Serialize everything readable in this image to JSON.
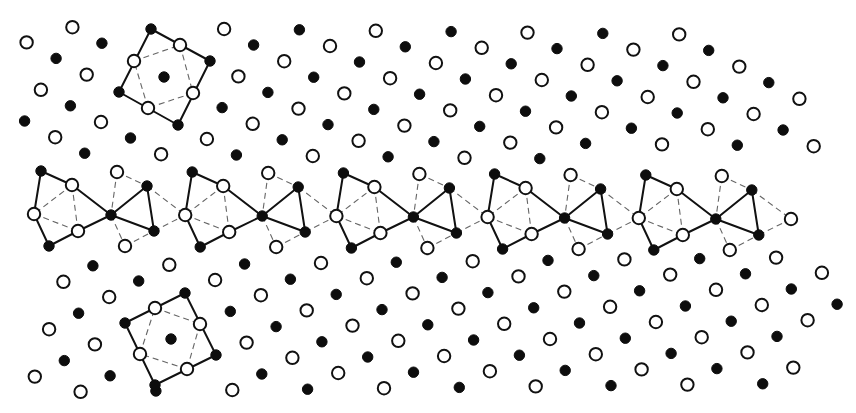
{
  "figure": {
    "width": 856,
    "height": 413,
    "colors": {
      "filled_atom": "#0d0d0d",
      "open_atom_stroke": "#111111",
      "open_atom_fill": "#ffffff",
      "solid_bond": "#111111",
      "dashed_bond": "#666666",
      "background": "#ffffff"
    },
    "atom_radius": {
      "filled": 5.2,
      "open": 6.2
    }
  },
  "lattices": {
    "upper": {
      "open_anchor": [
        330,
        46
      ],
      "a": [
        45.8,
        -15.2
      ],
      "b": [
        14.3,
        47.4
      ],
      "filled_offset": [
        29.5,
        16
      ],
      "y_max": 159
    },
    "lower": {
      "open_anchor": [
        321,
        263
      ],
      "a": [
        45.8,
        15.2
      ],
      "b": [
        -14.3,
        47.4
      ],
      "filled_offset": [
        29.5,
        -16
      ],
      "y_min": 255
    },
    "clip_polygon": [
      [
        15,
        20
      ],
      [
        700,
        20
      ],
      [
        720,
        40
      ],
      [
        808,
        90
      ],
      [
        845,
        200
      ],
      [
        845,
        240
      ],
      [
        840,
        300
      ],
      [
        815,
        370
      ],
      [
        795,
        398
      ],
      [
        20,
        398
      ],
      [
        28,
        350
      ],
      [
        55,
        265
      ],
      [
        20,
        240
      ],
      [
        15,
        160
      ]
    ],
    "exclusions": [
      {
        "center": [
          164,
          77
        ],
        "radius": 52
      },
      {
        "center": [
          171,
          339
        ],
        "radius": 52
      }
    ]
  },
  "square_units": [
    {
      "name": "upper-square-unit",
      "corners_filled": [
        [
          151,
          29
        ],
        [
          210,
          61
        ],
        [
          178,
          125
        ],
        [
          119,
          92
        ]
      ],
      "edges_open": [
        [
          180,
          45
        ],
        [
          193,
          93
        ],
        [
          148,
          108
        ],
        [
          134,
          61
        ]
      ],
      "center_filled": [
        164,
        77
      ]
    },
    {
      "name": "lower-square-unit",
      "corners_filled": [
        [
          185,
          293
        ],
        [
          216,
          355
        ],
        [
          155,
          385
        ],
        [
          125,
          323
        ]
      ],
      "edges_open": [
        [
          200,
          324
        ],
        [
          187,
          369
        ],
        [
          140,
          354
        ],
        [
          155,
          308
        ]
      ],
      "center_filled": [
        171,
        339
      ]
    }
  ],
  "boundary_band": {
    "period": [
      151.2,
      1
    ],
    "count": 5,
    "unit": {
      "A_filled": [
        41,
        171
      ],
      "B_open": [
        72,
        185
      ],
      "C_open": [
        34,
        214
      ],
      "D_open": [
        78,
        231
      ],
      "E_filled": [
        49,
        246
      ],
      "F_filled": [
        111,
        215
      ],
      "G_open": [
        117,
        172
      ],
      "H_filled": [
        147,
        186
      ],
      "I_filled": [
        154,
        231
      ],
      "J_open": [
        125,
        246
      ]
    },
    "solid_bonds": [
      [
        "A_filled",
        "B_open"
      ],
      [
        "B_open",
        "F_filled"
      ],
      [
        "F_filled",
        "D_open"
      ],
      [
        "D_open",
        "E_filled"
      ],
      [
        "E_filled",
        "C_open"
      ],
      [
        "C_open",
        "A_filled"
      ],
      [
        "F_filled",
        "H_filled"
      ],
      [
        "H_filled",
        "I_filled"
      ],
      [
        "I_filled",
        "F_filled"
      ]
    ],
    "dashed_bonds": [
      [
        "B_open",
        "C_open"
      ],
      [
        "C_open",
        "D_open"
      ],
      [
        "B_open",
        "D_open"
      ],
      [
        "G_open",
        "F_filled"
      ],
      [
        "F_filled",
        "J_open"
      ],
      [
        "G_open",
        "H_filled"
      ],
      [
        "J_open",
        "I_filled"
      ],
      [
        "H_filled",
        "NEXT_C"
      ],
      [
        "I_filled",
        "NEXT_C"
      ]
    ],
    "terminal_open": [
      791,
      219
    ]
  }
}
